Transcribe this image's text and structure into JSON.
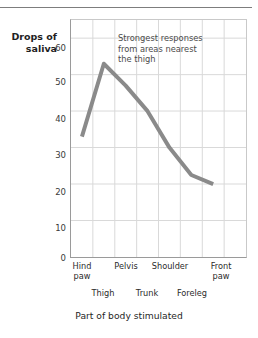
{
  "chart_data": {
    "type": "line",
    "title": "",
    "xlabel": "Part of body stimulated",
    "ylabel": "Drops of saliva",
    "categories": [
      "Hind paw",
      "Thigh",
      "Pelvis",
      "Trunk",
      "Shoulder",
      "Foreleg",
      "Front paw"
    ],
    "values": [
      33,
      53,
      47,
      40,
      30,
      22.5,
      20
    ],
    "ylim": [
      0,
      65
    ],
    "yticks": [
      0,
      10,
      20,
      30,
      40,
      50,
      60
    ],
    "xlim": [
      0,
      8
    ],
    "x_positions": [
      0.5,
      1.5,
      2.5,
      3.5,
      4.5,
      5.5,
      6.5
    ],
    "grid": true,
    "legend": "none",
    "series_color": "#8a8a8a",
    "grid_color": "#d6d6d6",
    "annotations": [
      {
        "name": "strongest-response-note",
        "text": "Strongest responses from areas nearest the thigh",
        "lines": [
          "Strongest responses",
          "from areas nearest",
          "the thigh"
        ]
      }
    ]
  },
  "axes": {
    "y_label_lines": [
      "Drops of",
      "saliva"
    ],
    "y_label_line1": "Drops of",
    "y_label_line2": "saliva",
    "y_ticks": [
      "60",
      "50",
      "40",
      "30",
      "20",
      "10",
      "0"
    ],
    "x_labels_top": [
      {
        "line1": "Hind",
        "line2": "paw"
      },
      {
        "line1": "Pelvis",
        "line2": ""
      },
      {
        "line1": "Shoulder",
        "line2": ""
      },
      {
        "line1": "Front",
        "line2": "paw"
      }
    ],
    "x_labels_bottom": [
      "Thigh",
      "Trunk",
      "Foreleg"
    ],
    "x_title": "Part of body stimulated"
  },
  "annotation": {
    "line1": "Strongest responses",
    "line2": "from areas nearest",
    "line3": "the thigh"
  },
  "colors": {
    "series": "#8a8a8a",
    "grid": "#d6d6d6",
    "axis": "#9a9a9a",
    "rule": "#7d7d7d",
    "text": "#2b2b2b"
  }
}
